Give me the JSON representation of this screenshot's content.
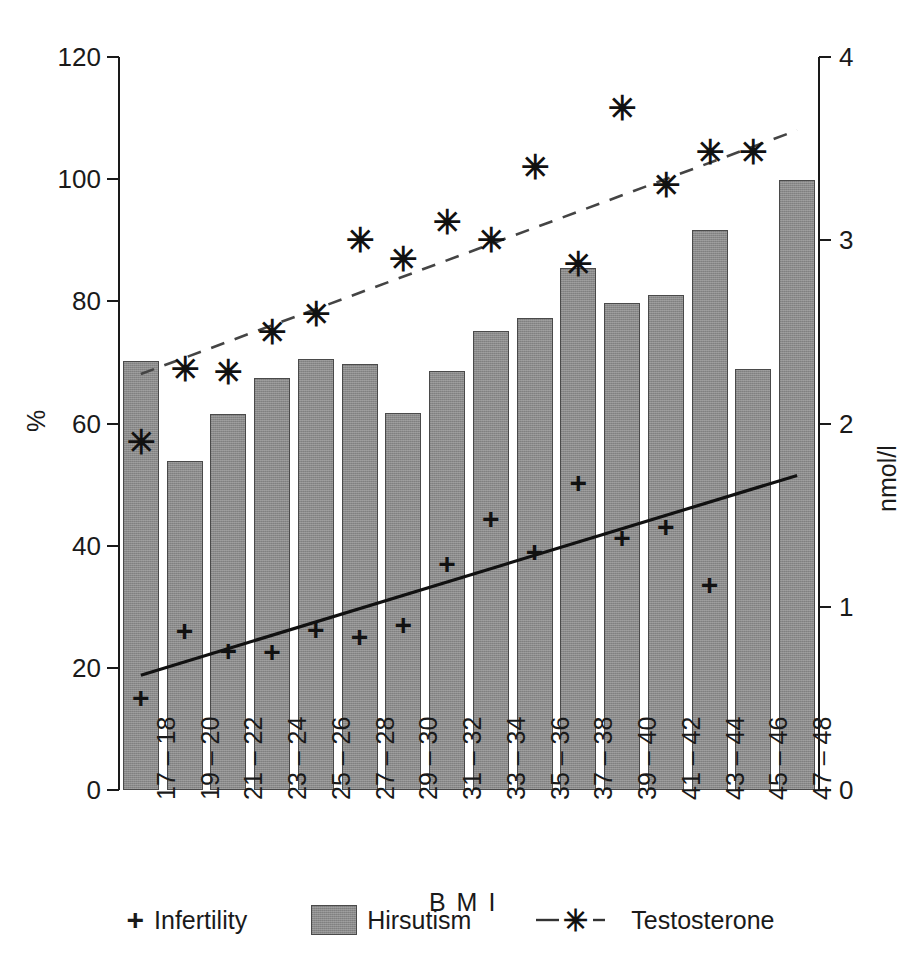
{
  "top_cut_text": "",
  "axes": {
    "left": {
      "title": "%",
      "ticks": [
        0,
        20,
        40,
        60,
        80,
        100,
        120
      ],
      "min": 0,
      "max": 120
    },
    "right": {
      "title": "nmol/l",
      "ticks": [
        0,
        1,
        2,
        3,
        4
      ],
      "min": 0,
      "max": 4
    },
    "x": {
      "title": "B M I",
      "categories": [
        "17 – 18",
        "19 – 20",
        "21 – 22",
        "23 – 24",
        "25 – 26",
        "27 – 28",
        "29 – 30",
        "31 – 32",
        "33 – 34",
        "35 – 36",
        "37 – 38",
        "39 – 40",
        "41 – 42",
        "43 – 44",
        "45 – 46",
        "47 – 48"
      ]
    }
  },
  "legend": {
    "items": [
      {
        "label": "Infertility",
        "marker": "plus-marker",
        "glyph": "+"
      },
      {
        "label": "Hirsutism",
        "marker": "gray-swatch",
        "glyph": ""
      },
      {
        "label": "Testosterone",
        "marker": "dashed-star-marker",
        "glyph": "✳"
      }
    ]
  },
  "colors": {
    "bar_fill": "#8a8a8a",
    "bar_stroke": "#4a4a4a",
    "marker": "#111111",
    "axis": "#1a1a1a",
    "trend_solid": "#111111",
    "trend_dashed": "#444444"
  },
  "chart_data": {
    "type": "bar",
    "title": "",
    "xlabel": "B M I",
    "ylabel": "%",
    "y2label": "nmol/l",
    "ylim": [
      0,
      120
    ],
    "y2lim": [
      0,
      4
    ],
    "grid": false,
    "legend_position": "bottom",
    "categories": [
      "17 – 18",
      "19 – 20",
      "21 – 22",
      "23 – 24",
      "25 – 26",
      "27 – 28",
      "29 – 30",
      "31 – 32",
      "33 – 34",
      "35 – 36",
      "37 – 38",
      "39 – 40",
      "41 – 42",
      "43 – 44",
      "45 – 46",
      "47 – 48"
    ],
    "series": [
      {
        "name": "Hirsutism",
        "kind": "bar",
        "axis": "left",
        "unit": "%",
        "values": [
          70.3,
          53.8,
          61.6,
          67.5,
          70.6,
          69.8,
          61.7,
          68.6,
          75.2,
          77.3,
          85.5,
          79.8,
          81.1,
          91.7,
          69.0,
          99.8
        ]
      },
      {
        "name": "Infertility",
        "kind": "scatter",
        "marker": "+",
        "axis": "left",
        "unit": "%",
        "values": [
          15.0,
          26.0,
          22.7,
          22.6,
          26.2,
          25.0,
          27.0,
          37.0,
          44.3,
          39.0,
          50.2,
          41.3,
          43.0,
          33.6,
          null,
          null
        ]
      },
      {
        "name": "Testosterone",
        "kind": "scatter",
        "marker": "✳",
        "axis": "right",
        "unit": "nmol/l",
        "values": [
          1.9,
          2.3,
          2.28,
          2.5,
          2.6,
          3.0,
          2.9,
          3.1,
          3.0,
          3.4,
          2.87,
          3.72,
          3.3,
          3.48,
          3.48,
          null
        ]
      }
    ],
    "trendlines": [
      {
        "name": "Infertility trend",
        "style": "solid",
        "axis": "left",
        "x0": 0,
        "y0": 18.8,
        "x1": 15,
        "y1": 51.5
      },
      {
        "name": "Testosterone trend",
        "style": "dashed",
        "axis": "right",
        "x0": 0,
        "y0": 2.27,
        "x1": 15,
        "y1": 3.6
      }
    ]
  }
}
